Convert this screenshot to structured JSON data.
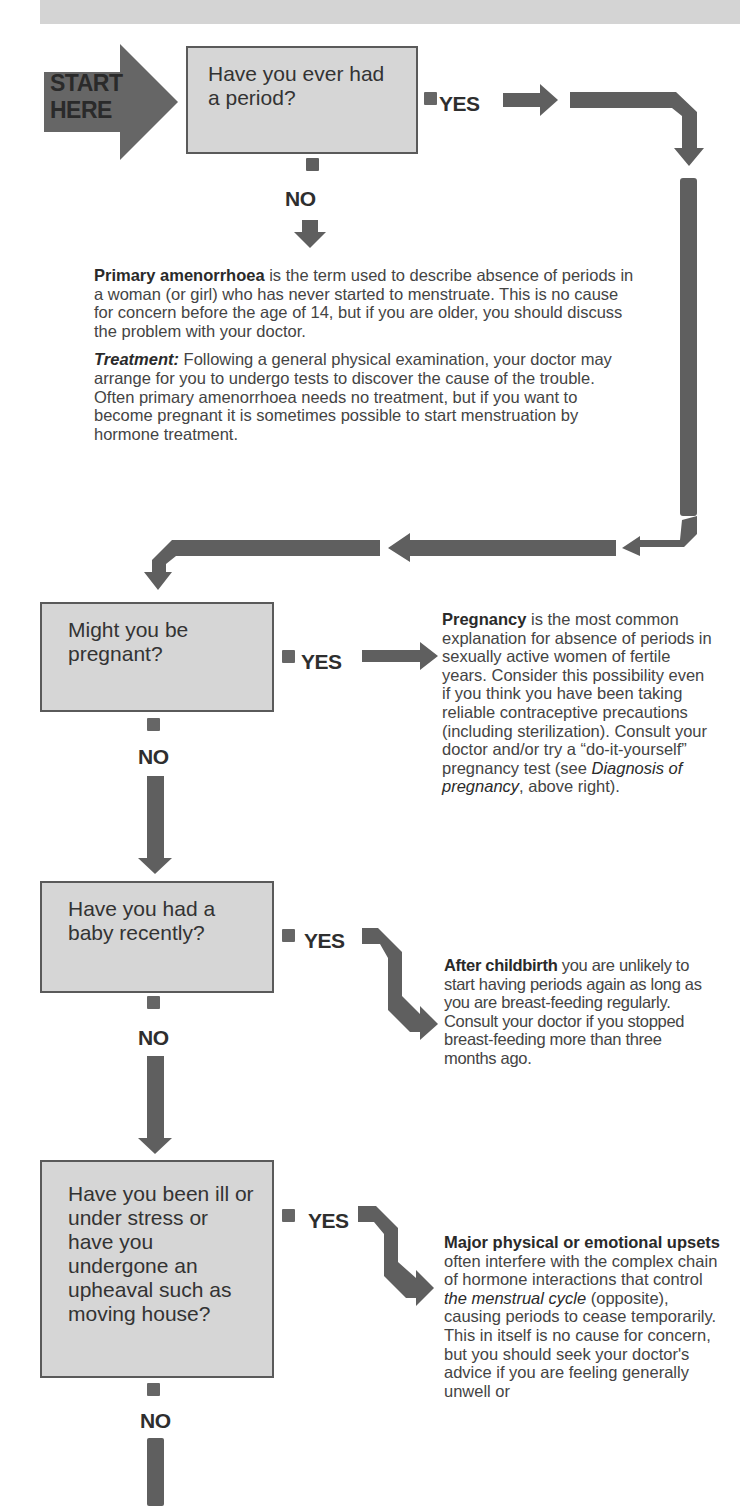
{
  "header_band": "",
  "start": {
    "line1": "START",
    "line2": "HERE"
  },
  "questions": [
    {
      "id": "q1",
      "text": "Have you ever had a period?"
    },
    {
      "id": "q2",
      "text": "Might you be pregnant?"
    },
    {
      "id": "q3",
      "text": "Have you had a baby recently?"
    },
    {
      "id": "q4",
      "text": "Have you been ill or under stress or have you undergone an upheaval such as moving house?"
    }
  ],
  "labels": {
    "yes": "YES",
    "no": "NO"
  },
  "answers": {
    "primary_amenorrhoea": {
      "term": "Primary amenorrhoea",
      "body": " is the term used to describe absence of periods in a woman (or girl) who has never started to menstruate. This is no cause for concern before the age of 14, but if you are older, you should discuss the problem with your doctor.",
      "treatment_label": "Treatment:",
      "treatment_body": " Following a general physical examination, your doctor may arrange for you to undergo tests to discover the cause of the trouble. Often primary amenorrhoea needs no treatment, but if you want to become pregnant it is sometimes possible to start menstruation by hormone treatment."
    },
    "pregnancy": {
      "term": "Pregnancy",
      "body": " is the most common explanation for absence of periods in sexually active women of fertile years. Consider this possibility even if you think you have been taking reliable contraceptive precautions (including sterilization). Consult your doctor and/or try a “do-it-yourself” pregnancy test (see ",
      "ref": "Diagnosis of pregnancy",
      "tail": ", above right)."
    },
    "childbirth": {
      "term": "After childbirth",
      "body": " you are unlikely to start having periods again as long as you are breast-feeding regularly. Consult your doctor if you stopped breast-feeding more than three months ago."
    },
    "upsets": {
      "term": "Major physical or emotional upsets",
      "body": " often interfere with the complex chain of hormone interactions that control ",
      "ref": "the menstrual cycle",
      "tail": " (opposite), causing periods to cease temporarily. This in itself is no cause for concern, but you should seek your doctor's advice if you are feeling generally unwell or"
    }
  },
  "colors": {
    "arrow": "#5f5f5f",
    "box_fill": "#d6d6d6",
    "box_border": "#5a5a5a",
    "start_fill": "#666666",
    "text": "#3a3a3a"
  }
}
